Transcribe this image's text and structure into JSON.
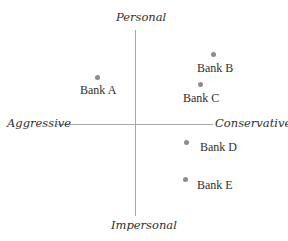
{
  "diagram": {
    "type": "perceptual-map",
    "axes": {
      "top": "Personal",
      "bottom": "Impersonal",
      "left": "Aggressive",
      "right": "Conservative"
    },
    "colors": {
      "axis": "#a8a8a8",
      "point": "#8c8c8c",
      "text": "#2f2f2f"
    },
    "points": [
      {
        "label": "Bank A",
        "dot": [
          95,
          75
        ],
        "text": [
          80,
          84
        ]
      },
      {
        "label": "Bank B",
        "dot": [
          211,
          52
        ],
        "text": [
          197,
          62
        ]
      },
      {
        "label": "Bank C",
        "dot": [
          198,
          82
        ],
        "text": [
          183,
          92
        ]
      },
      {
        "label": "Bank D",
        "dot": [
          184,
          140
        ],
        "text": [
          200,
          141
        ]
      },
      {
        "label": "Bank E",
        "dot": [
          183,
          177
        ],
        "text": [
          197,
          179
        ]
      }
    ]
  }
}
